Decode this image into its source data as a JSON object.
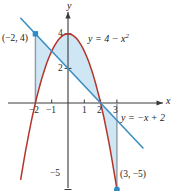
{
  "figure": {
    "axis_labels": {
      "x": "x",
      "y": "y"
    },
    "equations": {
      "parabola": "y = 4 − x",
      "parabola_exponent": "2",
      "line": "y = −x + 2"
    },
    "points": [
      {
        "label": "(−2, 4)",
        "x": -2,
        "y": 4
      },
      {
        "label": "(3, −5)",
        "x": 3,
        "y": -5
      }
    ],
    "ticks": {
      "x": [
        "−2",
        "−1",
        "1",
        "2",
        "3"
      ],
      "y": [
        "4",
        "2",
        "−5"
      ]
    },
    "colors": {
      "parabola": "#b5342a",
      "line": "#3f8fc4",
      "shading": "#cfe6f4",
      "axis": "#3a3a3a",
      "marker": "#2e8ccb",
      "connector": "#8c9aa6"
    }
  },
  "chart_data": {
    "type": "line",
    "title": "",
    "xlabel": "x",
    "ylabel": "y",
    "xlim": [
      -2.9,
      4.6
    ],
    "ylim": [
      -5.8,
      5.2
    ],
    "grid": false,
    "legend": "none",
    "series": [
      {
        "name": "y = 4 - x^2",
        "type": "parabola",
        "color": "#b5342a",
        "expression": "4 - x^2",
        "domain": [
          -2.9,
          3.2
        ],
        "vertex": [
          0,
          4
        ],
        "roots": [
          -2,
          2
        ]
      },
      {
        "name": "y = -x + 2",
        "type": "line",
        "color": "#3f8fc4",
        "expression": "-x + 2",
        "domain": [
          -2.9,
          4.6
        ],
        "slope": -1,
        "intercept": 2
      }
    ],
    "intersections": [
      {
        "x": -2,
        "y": 4
      },
      {
        "x": 3,
        "y": -5
      }
    ],
    "shaded_region": {
      "between": [
        "y = 4 - x^2",
        "y = -x + 2"
      ],
      "from_x": -2,
      "to_x": 3,
      "color": "#cfe6f4"
    },
    "annotations": [
      {
        "text": "(−2, 4)",
        "x": -2,
        "y": 4
      },
      {
        "text": "(3, −5)",
        "x": 3,
        "y": -5
      },
      {
        "text": "y = 4 − x²",
        "x": 1.3,
        "y": 4.05
      },
      {
        "text": "y = −x + 2",
        "x": 3.4,
        "y": -0.7
      }
    ],
    "xticks": [
      -2,
      -1,
      1,
      2,
      3
    ],
    "yticks": [
      4,
      2,
      -5
    ]
  }
}
